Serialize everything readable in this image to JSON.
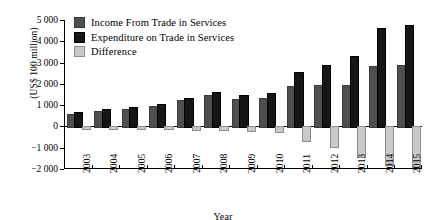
{
  "chart_data": {
    "type": "bar",
    "title": "",
    "xlabel": "Year",
    "ylabel": "(US$ 100 million)",
    "ylim": [
      -2000,
      5000
    ],
    "ytick_step": 1000,
    "yticks": [
      5000,
      4000,
      3000,
      2000,
      1000,
      0,
      -1000,
      -2000
    ],
    "ytick_labels": [
      "5 000",
      "4 000",
      "3 000",
      "2 000",
      "1 000",
      "0",
      "−1 000",
      "−2 000"
    ],
    "grid": false,
    "legend_position": "upper-left-inside",
    "categories": [
      "2003",
      "2004",
      "2005",
      "2006",
      "2007",
      "2008",
      "2009",
      "2010",
      "2011",
      "2012",
      "2013",
      "2014",
      "2015"
    ],
    "series": [
      {
        "name": "Income From Trade in Services",
        "color": "#4f4f4f",
        "values": [
          600,
          720,
          820,
          960,
          1240,
          1490,
          1300,
          1340,
          1910,
          1960,
          1940,
          2840,
          2900
        ]
      },
      {
        "name": "Expenditure on Trade in Services",
        "color": "#161616",
        "values": [
          680,
          800,
          900,
          1040,
          1340,
          1610,
          1490,
          1550,
          2540,
          2880,
          3310,
          4620,
          4770
        ]
      },
      {
        "name": "Difference",
        "color": "#c9c9c9",
        "values": [
          -80,
          -90,
          -90,
          -90,
          -100,
          -120,
          -190,
          -220,
          -630,
          -920,
          -1370,
          -1780,
          -1870
        ]
      }
    ]
  },
  "legend": {
    "items": [
      {
        "label": "Income From Trade in Services",
        "key": "income"
      },
      {
        "label": "Expenditure on Trade in Services",
        "key": "expenditure"
      },
      {
        "label": "Difference",
        "key": "difference"
      }
    ]
  },
  "axes": {
    "y_title": "(US$ 100 million)",
    "x_title": "Year"
  }
}
